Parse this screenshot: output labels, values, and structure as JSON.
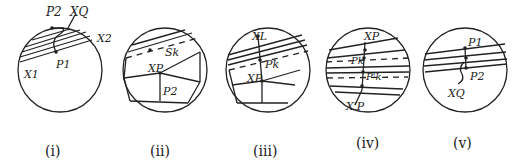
{
  "panels": [
    {
      "caption": "(i)",
      "labels": {
        "p2": "P2",
        "xq": "XQ",
        "x2": "X2",
        "x1": "X1",
        "p1": "P1"
      }
    },
    {
      "caption": "(ii)",
      "labels": {
        "sk": "Sk",
        "xp": "XP",
        "p2": "P2"
      }
    },
    {
      "caption": "(iii)",
      "labels": {
        "xl": "XL",
        "pk": "Pk",
        "xp": "XP"
      }
    },
    {
      "caption": "(iv)",
      "labels": {
        "xp_top": "XP",
        "pk": "Pk",
        "pk2": "P'k",
        "xp_bot": "X'P"
      }
    },
    {
      "caption": "(v)",
      "labels": {
        "p1": "P1",
        "p2": "P2",
        "xq": "XQ"
      }
    }
  ]
}
